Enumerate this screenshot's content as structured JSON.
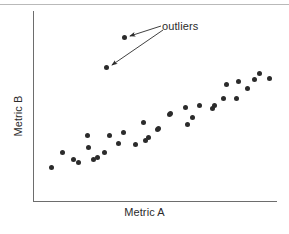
{
  "figure": {
    "background_color": "#ffffff",
    "point_color": "#2b2b2b",
    "axis_color": "#6d6d6d",
    "text_color": "#2b2b2b",
    "top_rule_color": "#b9b9b9"
  },
  "labels": {
    "x_axis": "Metric A",
    "y_axis": "Metric B",
    "annotation": "outliers"
  },
  "chart_data": {
    "type": "scatter",
    "title": "",
    "xlabel": "Metric A",
    "ylabel": "Metric B",
    "xlim": [
      0,
      100
    ],
    "ylim": [
      0,
      100
    ],
    "grid": false,
    "legend": false,
    "axis_ticks": {
      "x": [],
      "y": []
    },
    "annotations": [
      {
        "text": "outliers",
        "text_x": 162,
        "text_y": 20,
        "targets": [
          {
            "label": "outlier-1",
            "x": 124,
            "y": 37
          },
          {
            "label": "outlier-2",
            "x": 106,
            "y": 67
          }
        ]
      }
    ],
    "series": [
      {
        "name": "main-cluster",
        "marker": "circle",
        "color": "#2b2b2b",
        "points_px": [
          [
            51,
            167
          ],
          [
            62,
            152
          ],
          [
            73,
            159
          ],
          [
            78,
            162
          ],
          [
            87,
            135
          ],
          [
            88,
            147
          ],
          [
            93,
            159
          ],
          [
            97,
            157
          ],
          [
            104,
            152
          ],
          [
            109,
            135
          ],
          [
            118,
            143
          ],
          [
            123,
            132
          ],
          [
            135,
            144
          ],
          [
            143,
            122
          ],
          [
            145,
            140
          ],
          [
            148,
            137
          ],
          [
            157,
            129
          ],
          [
            158,
            128
          ],
          [
            169,
            114
          ],
          [
            170,
            113
          ],
          [
            185,
            107
          ],
          [
            187,
            124
          ],
          [
            192,
            117
          ],
          [
            199,
            105
          ],
          [
            212,
            108
          ],
          [
            214,
            105
          ],
          [
            223,
            98
          ],
          [
            226,
            84
          ],
          [
            236,
            98
          ],
          [
            238,
            81
          ],
          [
            247,
            88
          ],
          [
            254,
            79
          ],
          [
            259,
            73
          ],
          [
            269,
            78
          ]
        ],
        "points_data": [
          [
            7,
            22
          ],
          [
            12,
            32
          ],
          [
            16,
            27
          ],
          [
            18,
            25
          ],
          [
            22,
            43
          ],
          [
            23,
            35
          ],
          [
            25,
            27
          ],
          [
            26,
            28
          ],
          [
            29,
            31
          ],
          [
            31,
            43
          ],
          [
            35,
            37
          ],
          [
            37,
            44
          ],
          [
            42,
            36
          ],
          [
            45,
            52
          ],
          [
            46,
            39
          ],
          [
            47,
            41
          ],
          [
            51,
            47
          ],
          [
            51,
            48
          ],
          [
            56,
            57
          ],
          [
            56,
            58
          ],
          [
            62,
            62
          ],
          [
            63,
            51
          ],
          [
            65,
            56
          ],
          [
            68,
            63
          ],
          [
            73,
            61
          ],
          [
            74,
            63
          ],
          [
            78,
            68
          ],
          [
            79,
            78
          ],
          [
            83,
            68
          ],
          [
            84,
            80
          ],
          [
            88,
            74
          ],
          [
            91,
            80
          ],
          [
            93,
            85
          ],
          [
            97,
            81
          ]
        ]
      },
      {
        "name": "outliers",
        "marker": "circle",
        "color": "#2b2b2b",
        "points_px": [
          [
            124,
            37
          ],
          [
            106,
            67
          ]
        ],
        "points_data": [
          [
            38,
            91
          ],
          [
            30,
            75
          ]
        ]
      }
    ]
  }
}
